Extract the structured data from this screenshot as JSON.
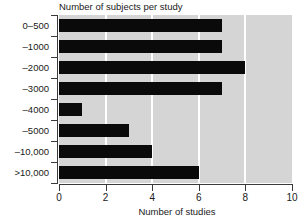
{
  "chart_data": {
    "type": "bar",
    "orientation": "horizontal",
    "title": "Number of subjects per study",
    "xlabel": "Number of studies",
    "ylabel": "",
    "categories": [
      "0–500",
      "–1000",
      "–2000",
      "–3000",
      "–4000",
      "–5000",
      "–10,000",
      ">10,000"
    ],
    "values": [
      7,
      7,
      8,
      7,
      1,
      3,
      4,
      6
    ],
    "xlim": [
      0,
      10
    ],
    "xticks": [
      0,
      2,
      4,
      6,
      8,
      10
    ],
    "xtick_labels": [
      "0",
      "2",
      "4",
      "6",
      "8",
      "10"
    ],
    "gridlines_at": [
      2,
      4,
      6,
      8
    ],
    "grid": true,
    "legend": false,
    "colors": {
      "bar": "#0a0a0a",
      "plot_background": "#d5d5d5",
      "gridline": "#ffffff",
      "axis": "#3a3a3a",
      "text": "#1a1a1a",
      "page_background": "#ffffff"
    }
  }
}
